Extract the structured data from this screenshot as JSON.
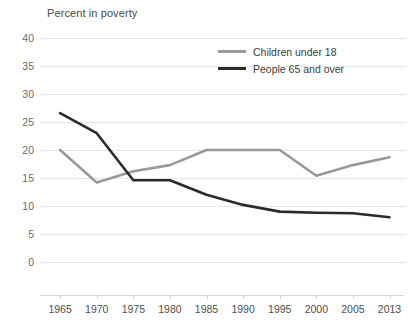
{
  "chart_data": {
    "type": "line",
    "title": "Percent in poverty",
    "xlabel": "",
    "ylabel": "Percent in poverty",
    "x": [
      1965,
      1970,
      1975,
      1980,
      1985,
      1990,
      1995,
      2000,
      2005,
      2013
    ],
    "categories": [
      "1965",
      "1970",
      "1975",
      "1980",
      "1985",
      "1990",
      "1995",
      "2000",
      "2005",
      "2013"
    ],
    "series": [
      {
        "name": "Children under 18",
        "color": "#999999",
        "values": [
          20.0,
          14.2,
          16.2,
          17.3,
          20.0,
          20.0,
          20.0,
          15.4,
          17.3,
          18.7
        ]
      },
      {
        "name": "People 65 and over",
        "color": "#2b2b2b",
        "values": [
          26.6,
          23.0,
          14.6,
          14.6,
          12.0,
          10.2,
          9.0,
          8.8,
          8.7,
          8.0
        ]
      }
    ],
    "ylim": [
      0,
      40
    ],
    "ytick_labels": [
      "40",
      "35",
      "30",
      "25",
      "20",
      "15",
      "10",
      "5",
      "0"
    ],
    "ytick_values": [
      40,
      35,
      30,
      25,
      20,
      15,
      10,
      5,
      0
    ],
    "grid": true,
    "legend_position": "top-right"
  },
  "legend": {
    "entries": [
      {
        "label": "Children under 18",
        "color": "#999999"
      },
      {
        "label": "People 65 and over",
        "color": "#2b2b2b"
      }
    ]
  }
}
